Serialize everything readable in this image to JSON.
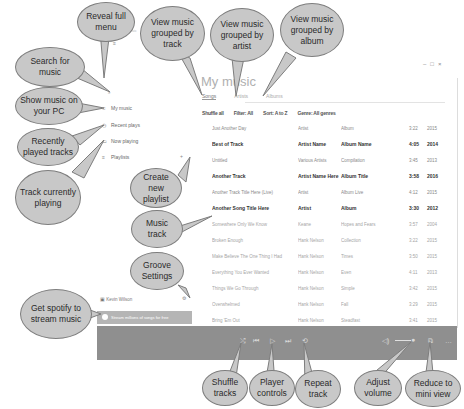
{
  "app": {
    "title_bar": "Groove Music",
    "page_title": "My music",
    "window_controls": [
      "–",
      "□",
      "×"
    ]
  },
  "sidebar": {
    "items": [
      {
        "icon": "hamburger-icon",
        "glyph": "≡",
        "label": ""
      },
      {
        "icon": "search-icon",
        "glyph": "⌕",
        "label": ""
      },
      {
        "icon": "music-note-icon",
        "glyph": "♫",
        "label": "My music"
      },
      {
        "icon": "clock-icon",
        "glyph": "◷",
        "label": "Recent plays"
      },
      {
        "icon": "speaker-icon",
        "glyph": "▭",
        "label": "Now playing"
      },
      {
        "icon": "list-icon",
        "glyph": "≡",
        "label": "Playlists"
      }
    ],
    "user_label": "Kevin Wilson",
    "settings_glyph": "⚙",
    "spotify_banner": "Stream millions of songs for free"
  },
  "tabs": [
    {
      "label": "Songs",
      "active": true
    },
    {
      "label": "Artists",
      "active": false
    },
    {
      "label": "Albums",
      "active": false
    }
  ],
  "filters": [
    "Shuffle all",
    "Filter: All",
    "Sort: A to Z",
    "Genre: All genres"
  ],
  "tracks": [
    {
      "title": "Just Another Day",
      "artist": "Artist",
      "album": "Album",
      "duration": "3:22",
      "year": "2015",
      "style": "normal"
    },
    {
      "title": "Best of Track",
      "artist": "Artist Name",
      "album": "Album Name",
      "duration": "4:05",
      "year": "2014",
      "style": "bold"
    },
    {
      "title": "Untitled",
      "artist": "Various Artists",
      "album": "Compilation",
      "duration": "3:45",
      "year": "2013",
      "style": "normal"
    },
    {
      "title": "Another Track",
      "artist": "Artist Name Here",
      "album": "Album Title",
      "duration": "3:58",
      "year": "2016",
      "style": "bold"
    },
    {
      "title": "Another Track Title Here (Live)",
      "artist": "Artist",
      "album": "Album Live",
      "duration": "4:12",
      "year": "2015",
      "style": "normal"
    },
    {
      "title": "Another Song Title Here",
      "artist": "Artist",
      "album": "Album",
      "duration": "3:30",
      "year": "2012",
      "style": "bold"
    },
    {
      "title": "Somewhere Only We Know",
      "artist": "Keane",
      "album": "Hopes and Fears",
      "duration": "3:57",
      "year": "2004",
      "style": "light"
    },
    {
      "title": "Broken Enough",
      "artist": "Hank Nelson",
      "album": "Collection",
      "duration": "3:22",
      "year": "2015",
      "style": "light"
    },
    {
      "title": "Make Believe The One Thing I Had",
      "artist": "Hank Nelson",
      "album": "Times",
      "duration": "3:50",
      "year": "2015",
      "style": "light"
    },
    {
      "title": "Everything You Ever Wanted",
      "artist": "Hank Nelson",
      "album": "Even",
      "duration": "4:11",
      "year": "2013",
      "style": "light"
    },
    {
      "title": "Things We Go Through",
      "artist": "Hank Nelson",
      "album": "Simple",
      "duration": "3:42",
      "year": "2015",
      "style": "light"
    },
    {
      "title": "Overwhelmed",
      "artist": "Hank Nelson",
      "album": "Fall",
      "duration": "3:29",
      "year": "2015",
      "style": "light"
    },
    {
      "title": "Bring 'Em Out",
      "artist": "Hank Nelson",
      "album": "Steadfast",
      "duration": "3:41",
      "year": "2015",
      "style": "light"
    }
  ],
  "player": {
    "shuffle_glyph": "⤮",
    "prev_glyph": "⏮",
    "play_glyph": "▷",
    "next_glyph": "⏭",
    "repeat_glyph": "⟲",
    "volume_glyph": "◁)",
    "knob_glyph": "●",
    "mini_glyph": "⧉",
    "more_glyph": "…"
  },
  "callouts": {
    "reveal_menu": "Reveal full menu",
    "search": "Search for music",
    "show_pc": "Show music on your PC",
    "recent": "Recently played tracks",
    "now_playing": "Track currently playing",
    "group_track": "View music grouped by track",
    "group_artist": "View music grouped by artist",
    "group_album": "View music grouped by album",
    "new_playlist": "Create new playlist",
    "music_track": "Music track",
    "settings": "Groove Settings",
    "spotify": "Get spotify to stream music",
    "shuffle": "Shuffle tracks",
    "player_controls": "Player controls",
    "repeat": "Repeat track",
    "volume": "Adjust volume",
    "mini_view": "Reduce to mini view"
  }
}
